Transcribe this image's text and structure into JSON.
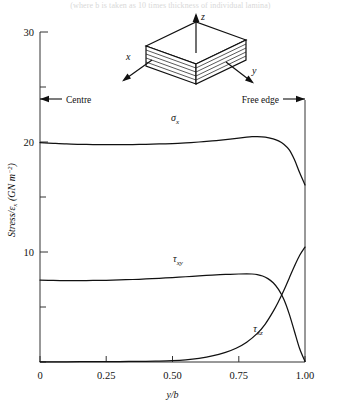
{
  "figure": {
    "top_caption": "(where b is taken as 10 times thickness of individual lamina)",
    "axes": {
      "y_label": "Stress/",
      "y_label_eps": "ε",
      "y_label_eps_sub": "x",
      "y_label_units": "(GN m",
      "y_label_units_exp": "−2",
      "y_label_units_close": ")",
      "y_ticks_labeled": [
        "10",
        "20",
        "30"
      ],
      "y_ticks_all": [
        0,
        5,
        10,
        15,
        20,
        25,
        30
      ],
      "y_min": 0,
      "y_max": 30,
      "x_label_num": "y",
      "x_label_slash": "/",
      "x_label_den": "b",
      "x_ticks": [
        "0",
        "0.25",
        "0.50",
        "0.75",
        "1.00"
      ],
      "x_tick_values": [
        0,
        0.25,
        0.5,
        0.75,
        1.0
      ],
      "x_min": 0,
      "x_max": 1.0
    },
    "annotations": {
      "centre": "Centre",
      "free_edge": "Free edge",
      "centre_arrow": "left-arrow-icon",
      "free_edge_arrow": "right-arrow-icon"
    },
    "inset": {
      "name": "laminate-block-diagram",
      "axis_z": "z",
      "axis_x": "x",
      "axis_y": "y",
      "ply_count": 5
    },
    "curve_labels": {
      "sigma_x": "σ",
      "sigma_x_sub": "x",
      "tau_xy": "τ",
      "tau_xy_sub": "xy",
      "tau_xz": "τ",
      "tau_xz_sub": "xz"
    },
    "colors": {
      "ink": "#111111",
      "axis": "#444444",
      "background": "#ffffff"
    }
  },
  "chart_data": {
    "type": "line",
    "title": "",
    "xlabel": "y/b",
    "ylabel": "Stress/εx (GN m−2)",
    "xlim": [
      0,
      1.0
    ],
    "ylim": [
      0,
      30
    ],
    "grid": false,
    "legend": "inline-curve-labels",
    "series": [
      {
        "name": "σx",
        "label": "sigma_x",
        "x": [
          0.0,
          0.05,
          0.1,
          0.15,
          0.2,
          0.25,
          0.3,
          0.35,
          0.4,
          0.45,
          0.5,
          0.55,
          0.6,
          0.65,
          0.7,
          0.75,
          0.78,
          0.8,
          0.82,
          0.85,
          0.88,
          0.9,
          0.92,
          0.94,
          0.96,
          0.98,
          1.0
        ],
        "y": [
          19.95,
          19.88,
          19.82,
          19.79,
          19.77,
          19.76,
          19.76,
          19.77,
          19.79,
          19.82,
          19.86,
          19.92,
          20.0,
          20.1,
          20.22,
          20.36,
          20.44,
          20.48,
          20.49,
          20.44,
          20.28,
          20.1,
          19.8,
          19.3,
          18.4,
          17.2,
          16.1
        ]
      },
      {
        "name": "τxy",
        "label": "tau_xy",
        "x": [
          0.0,
          0.05,
          0.1,
          0.15,
          0.2,
          0.25,
          0.3,
          0.35,
          0.4,
          0.45,
          0.5,
          0.55,
          0.6,
          0.65,
          0.7,
          0.75,
          0.78,
          0.8,
          0.82,
          0.84,
          0.86,
          0.88,
          0.9,
          0.92,
          0.94,
          0.96,
          0.98,
          1.0
        ],
        "y": [
          7.45,
          7.42,
          7.4,
          7.4,
          7.41,
          7.43,
          7.46,
          7.5,
          7.55,
          7.61,
          7.68,
          7.75,
          7.83,
          7.9,
          7.96,
          8.0,
          8.01,
          8.0,
          7.95,
          7.82,
          7.58,
          7.2,
          6.6,
          5.7,
          4.4,
          2.8,
          1.2,
          0.05
        ]
      },
      {
        "name": "τxz",
        "label": "tau_xz",
        "x": [
          0.0,
          0.1,
          0.2,
          0.3,
          0.4,
          0.45,
          0.5,
          0.55,
          0.6,
          0.65,
          0.7,
          0.74,
          0.78,
          0.82,
          0.85,
          0.88,
          0.9,
          0.92,
          0.94,
          0.96,
          0.98,
          1.0
        ],
        "y": [
          0.02,
          0.02,
          0.03,
          0.04,
          0.06,
          0.08,
          0.12,
          0.2,
          0.34,
          0.55,
          0.88,
          1.25,
          1.8,
          2.6,
          3.45,
          4.6,
          5.5,
          6.5,
          7.6,
          8.7,
          9.7,
          10.45
        ]
      }
    ]
  }
}
